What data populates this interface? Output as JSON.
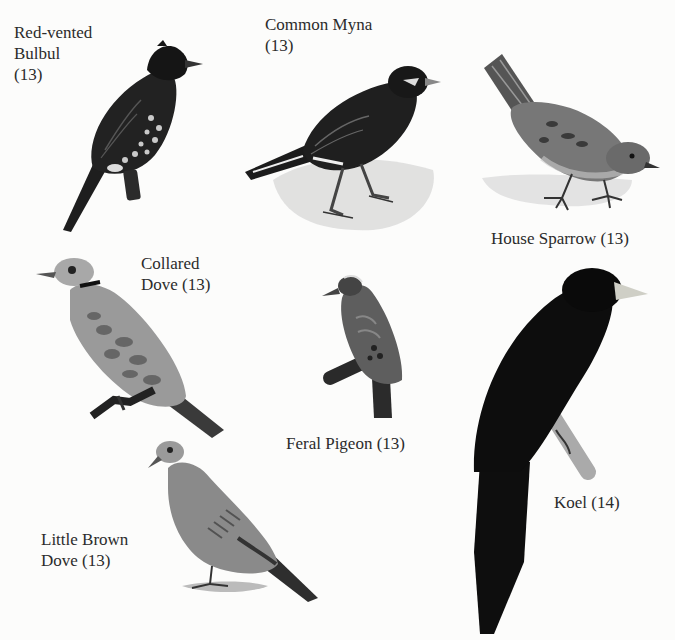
{
  "plate": {
    "background": "#fcfcfb",
    "ink_color": "#2b2b2b",
    "birds": [
      {
        "id": "red-vented-bulbul",
        "name_lines": [
          "Red-vented",
          "Bulbul",
          "(13)"
        ],
        "name": "Red-vented Bulbul",
        "page": "13"
      },
      {
        "id": "common-myna",
        "name_lines": [
          "Common Myna",
          "(13)"
        ],
        "name": "Common Myna",
        "page": "13"
      },
      {
        "id": "house-sparrow",
        "name_lines": [
          "House Sparrow (13)"
        ],
        "name": "House Sparrow",
        "page": "13"
      },
      {
        "id": "collared-dove",
        "name_lines": [
          "Collared",
          "Dove (13)"
        ],
        "name": "Collared Dove",
        "page": "13"
      },
      {
        "id": "feral-pigeon",
        "name_lines": [
          "Feral Pigeon (13)"
        ],
        "name": "Feral Pigeon",
        "page": "13"
      },
      {
        "id": "koel",
        "name_lines": [
          "Koel (14)"
        ],
        "name": "Koel",
        "page": "14"
      },
      {
        "id": "little-brown-dove",
        "name_lines": [
          "Little Brown",
          "Dove (13)"
        ],
        "name": "Little Brown Dove",
        "page": "13"
      }
    ]
  }
}
